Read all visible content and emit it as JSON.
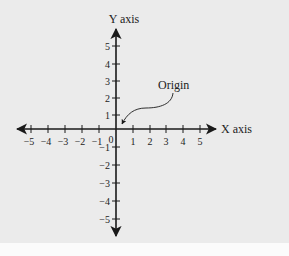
{
  "diagram": {
    "type": "cartesian-coordinate-plane",
    "x_axis": {
      "label": "X axis",
      "ticks": [
        -5,
        -4,
        -3,
        -2,
        -1,
        1,
        2,
        3,
        4,
        5
      ],
      "tick_labels": [
        "−5",
        "−4",
        "−3",
        "−2",
        "−1",
        "1",
        "2",
        "3",
        "4",
        "5"
      ]
    },
    "y_axis": {
      "label": "Y axis",
      "ticks": [
        5,
        4,
        3,
        2,
        1,
        -1,
        -2,
        -3,
        -4,
        -5
      ],
      "tick_labels": [
        "5",
        "4",
        "3",
        "2",
        "1",
        "−1",
        "−2",
        "−3",
        "−4",
        "−5"
      ]
    },
    "origin_label": "0",
    "annotation": {
      "text": "Origin",
      "points_to": [
        0,
        0
      ]
    },
    "colors": {
      "background": "#ebebeb",
      "axis": "#1a1a1a",
      "text": "#222222"
    }
  }
}
